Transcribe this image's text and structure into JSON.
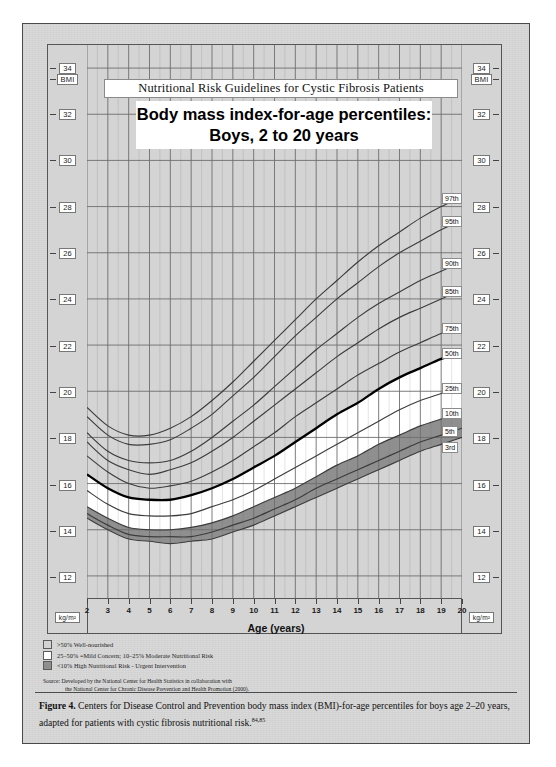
{
  "figure": {
    "caption_lead": "Figure 4.",
    "caption_text": " Centers for Disease Control and Prevention body mass index (BMI)-for-age percentiles for boys age 2–20 years, adapted for patients with cystic fibrosis nutritional risk.",
    "caption_refs": "84,85"
  },
  "header": {
    "band_title": "Nutritional Risk Guidelines for Cystic Fibrosis Patients",
    "title_line1": "Body mass index-for-age percentiles:",
    "title_line2": "Boys, 2 to 20 years"
  },
  "axes": {
    "y_top_label": "BMI",
    "y_bottom_label": "kg/m²",
    "x_title": "Age (years)"
  },
  "legend": {
    "items": [
      {
        "swatch": "#d4d4d4",
        "text": ">50% Well-nourished"
      },
      {
        "swatch": "#ffffff",
        "text": "25–50% =Mild Concern; 10–25% Moderate Nutritional Risk"
      },
      {
        "swatch": "#8f8f8f",
        "text": "<10% High Nutritional Risk - Urgent Intervention"
      }
    ],
    "source_line1": "Source: Developed by the National Center for Health Statistics in collaboration with",
    "source_line2": "the National Center for Chronic Disease Prevention and Health Promotion (2000)."
  },
  "colors": {
    "page_gray": "#d8d8d8",
    "plot_gray": "#d4d4d4",
    "band_white": "#ffffff",
    "band_dark": "#8f8f8f",
    "grid": "#6e6e6e",
    "curve": "#3c3c3c",
    "curve_bold": "#000000"
  },
  "chart_data": {
    "type": "line",
    "title": "Body mass index-for-age percentiles: Boys, 2 to 20 years",
    "subtitle": "Nutritional Risk Guidelines for Cystic Fibrosis Patients",
    "xlabel": "Age (years)",
    "ylabel": "BMI",
    "yunit": "kg/m²",
    "xlim": [
      2,
      20
    ],
    "ylim": [
      11,
      35
    ],
    "xticks": [
      2,
      3,
      4,
      5,
      6,
      7,
      8,
      9,
      10,
      11,
      12,
      13,
      14,
      15,
      16,
      17,
      18,
      19,
      20
    ],
    "yticks": [
      12,
      14,
      16,
      18,
      20,
      22,
      24,
      26,
      28,
      30,
      32,
      34
    ],
    "grid": true,
    "legend_position": "right-inline",
    "x": [
      2,
      3,
      4,
      5,
      6,
      7,
      8,
      9,
      10,
      11,
      12,
      13,
      14,
      15,
      16,
      17,
      18,
      19,
      20
    ],
    "series": [
      {
        "name": "97th",
        "label": "97th",
        "values": [
          19.3,
          18.5,
          18.1,
          18.1,
          18.4,
          18.9,
          19.6,
          20.4,
          21.3,
          22.2,
          23.1,
          24.0,
          24.8,
          25.6,
          26.3,
          26.9,
          27.5,
          28.0,
          28.4
        ]
      },
      {
        "name": "95th",
        "label": "95th",
        "values": [
          18.9,
          18.1,
          17.7,
          17.7,
          17.9,
          18.4,
          19.0,
          19.8,
          20.6,
          21.5,
          22.4,
          23.2,
          24.0,
          24.7,
          25.4,
          26.0,
          26.5,
          27.0,
          27.4
        ]
      },
      {
        "name": "90th",
        "label": "90th",
        "values": [
          18.2,
          17.4,
          17.0,
          16.9,
          17.0,
          17.4,
          18.0,
          18.7,
          19.4,
          20.2,
          21.0,
          21.8,
          22.5,
          23.2,
          23.8,
          24.3,
          24.8,
          25.2,
          25.6
        ]
      },
      {
        "name": "85th",
        "label": "85th",
        "values": [
          17.8,
          17.0,
          16.6,
          16.4,
          16.6,
          16.9,
          17.4,
          18.0,
          18.7,
          19.4,
          20.1,
          20.8,
          21.5,
          22.1,
          22.7,
          23.2,
          23.6,
          24.0,
          24.4
        ]
      },
      {
        "name": "75th",
        "label": "75th",
        "values": [
          17.2,
          16.5,
          16.0,
          15.8,
          15.9,
          16.1,
          16.5,
          17.0,
          17.6,
          18.2,
          18.9,
          19.5,
          20.1,
          20.7,
          21.2,
          21.7,
          22.1,
          22.5,
          22.8
        ]
      },
      {
        "name": "50th",
        "label": "50th",
        "values": [
          16.4,
          15.8,
          15.4,
          15.3,
          15.3,
          15.5,
          15.8,
          16.2,
          16.7,
          17.2,
          17.8,
          18.4,
          19.0,
          19.5,
          20.1,
          20.6,
          21.0,
          21.4,
          21.7
        ]
      },
      {
        "name": "25th",
        "label": "25th",
        "values": [
          15.7,
          15.1,
          14.7,
          14.6,
          14.6,
          14.7,
          15.0,
          15.3,
          15.7,
          16.2,
          16.7,
          17.2,
          17.7,
          18.2,
          18.7,
          19.2,
          19.6,
          19.9,
          20.2
        ]
      },
      {
        "name": "10th",
        "label": "10th",
        "values": [
          15.0,
          14.5,
          14.1,
          14.0,
          14.0,
          14.1,
          14.3,
          14.6,
          15.0,
          15.4,
          15.8,
          16.3,
          16.8,
          17.2,
          17.7,
          18.1,
          18.5,
          18.8,
          19.1
        ]
      },
      {
        "name": "5th",
        "label": "5th",
        "values": [
          14.7,
          14.2,
          13.8,
          13.7,
          13.7,
          13.7,
          13.9,
          14.2,
          14.5,
          14.9,
          15.3,
          15.8,
          16.2,
          16.6,
          17.0,
          17.4,
          17.8,
          18.1,
          18.4
        ]
      },
      {
        "name": "3rd",
        "label": "3rd",
        "values": [
          14.5,
          14.0,
          13.6,
          13.5,
          13.4,
          13.5,
          13.6,
          13.9,
          14.2,
          14.6,
          15.0,
          15.4,
          15.8,
          16.2,
          16.6,
          17.0,
          17.4,
          17.7,
          18.0
        ]
      }
    ],
    "bands": [
      {
        "name": "well-nourished",
        "from": "50th",
        "to": "top",
        "fill": "#d4d4d4",
        "meaning": ">50% Well-nourished"
      },
      {
        "name": "concern",
        "from": "10th",
        "to": "50th",
        "fill": "#ffffff",
        "meaning": "25–50% Mild Concern; 10–25% Moderate Nutritional Risk"
      },
      {
        "name": "high-risk",
        "from": "3rd",
        "to": "10th",
        "fill": "#8f8f8f",
        "meaning": "<10% High Nutritional Risk - Urgent Intervention"
      }
    ]
  }
}
